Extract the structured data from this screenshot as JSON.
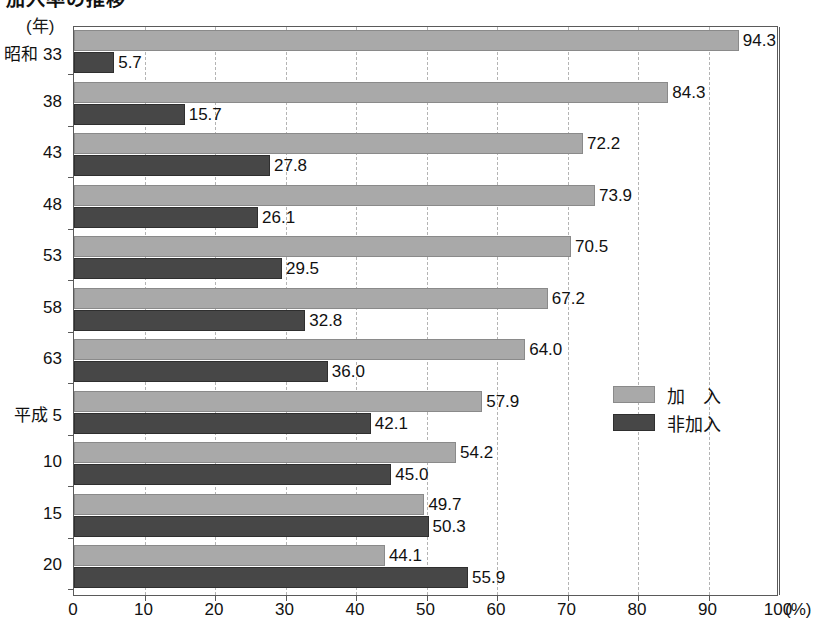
{
  "title": "加入率の推移",
  "unit_label": "(年)",
  "legend": {
    "position": "inside-right",
    "items": [
      {
        "key": "member",
        "label": "加　入",
        "color": "#a9a9a9"
      },
      {
        "key": "nonmember",
        "label": "非加入",
        "color": "#474747"
      }
    ]
  },
  "xaxis": {
    "unit": "(%)",
    "ticks": [
      "0",
      "10",
      "20",
      "30",
      "40",
      "50",
      "60",
      "70",
      "80",
      "90",
      "100"
    ]
  },
  "chart_data": {
    "type": "bar",
    "orientation": "horizontal",
    "title": "加入率の推移",
    "xlabel": "(%)",
    "ylabel": "(年)",
    "xlim": [
      0,
      100
    ],
    "grid": true,
    "legend_position": "inside-right",
    "categories": [
      "昭和 33",
      "38",
      "43",
      "48",
      "53",
      "58",
      "63",
      "平成 5",
      "10",
      "15",
      "20"
    ],
    "series": [
      {
        "name": "加　入",
        "color": "#a9a9a9",
        "values": [
          94.3,
          84.3,
          72.2,
          73.9,
          70.5,
          67.2,
          64.0,
          57.9,
          54.2,
          49.7,
          44.1
        ]
      },
      {
        "name": "非加入",
        "color": "#474747",
        "values": [
          5.7,
          15.7,
          27.8,
          26.1,
          29.5,
          32.8,
          36.0,
          42.1,
          45.0,
          50.3,
          55.9
        ]
      }
    ],
    "value_labels": {
      "加　入": [
        "94.3",
        "84.3",
        "72.2",
        "73.9",
        "70.5",
        "67.2",
        "64.0",
        "57.9",
        "54.2",
        "49.7",
        "44.1"
      ],
      "非加入": [
        "5.7",
        "15.7",
        "27.8",
        "26.1",
        "29.5",
        "32.8",
        "36.0",
        "42.1",
        "45.0",
        "50.3",
        "55.9"
      ]
    }
  }
}
